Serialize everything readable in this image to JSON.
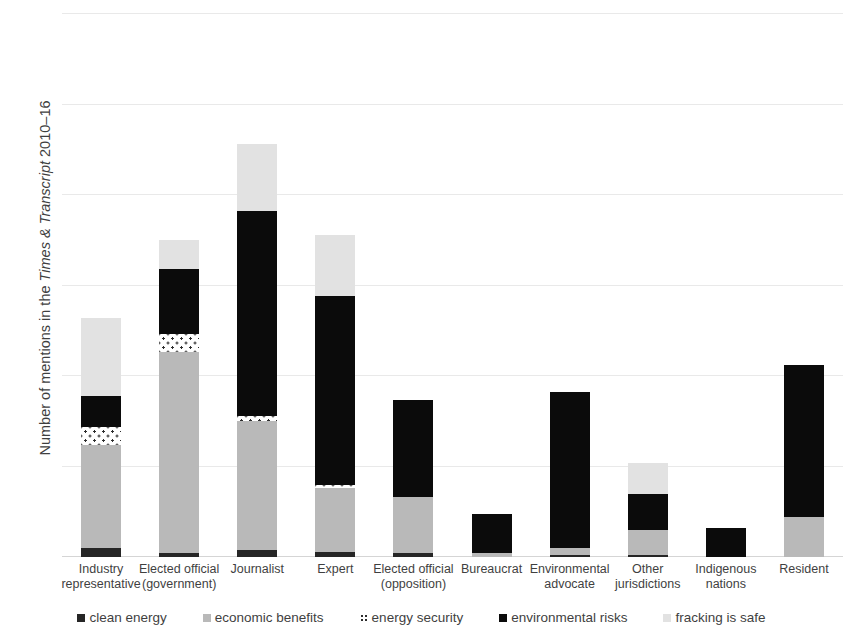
{
  "chart_data": {
    "type": "bar",
    "stacked": true,
    "title": "",
    "xlabel": "",
    "ylabel": "Number of mentions in the Times & Transcript 2010–16",
    "ylabel_parts": {
      "prefix": "Number of mentions in the ",
      "italic": "Times & Transcript",
      "suffix": " 2010–16"
    },
    "ylim": [
      0,
      300
    ],
    "ytick_labels": [
      "0",
      "50",
      "100",
      "150",
      "200",
      "250",
      "300"
    ],
    "ytick_values": [
      0,
      50,
      100,
      150,
      200,
      250,
      300
    ],
    "grid": true,
    "legend_position": "bottom",
    "categories": [
      "Industry representative",
      "Elected official (government)",
      "Journalist",
      "Expert",
      "Elected official (opposition)",
      "Bureaucrat",
      "Environmental advocate",
      "Other jurisdictions",
      "Indigenous nations",
      "Resident"
    ],
    "category_lines": [
      [
        "Industry",
        "representative"
      ],
      [
        "Elected official",
        "(government)"
      ],
      [
        "Journalist"
      ],
      [
        "Expert"
      ],
      [
        "Elected official",
        "(opposition)"
      ],
      [
        "Bureaucrat"
      ],
      [
        "Environmental",
        "advocate"
      ],
      [
        "Other",
        "jurisdictions"
      ],
      [
        "Indigenous",
        "nations"
      ],
      [
        "Resident"
      ]
    ],
    "series": [
      {
        "name": "clean energy",
        "color": "#262626",
        "values": [
          5,
          2,
          4,
          3,
          2,
          0,
          1,
          1,
          0,
          0
        ]
      },
      {
        "name": "economic benefits",
        "color": "#b9b9b9",
        "values": [
          57,
          111,
          71,
          35,
          31,
          2,
          4,
          14,
          0,
          22
        ]
      },
      {
        "name": "energy security",
        "color": "#ffffff",
        "pattern": "dotted",
        "values": [
          10,
          10,
          3,
          2,
          0,
          0,
          0,
          0,
          0,
          0
        ]
      },
      {
        "name": "environmental risks",
        "color": "#0b0b0b",
        "values": [
          17,
          36,
          113,
          104,
          54,
          22,
          86,
          20,
          16,
          84
        ]
      },
      {
        "name": "fracking is safe",
        "color": "#e2e2e2",
        "values": [
          43,
          16,
          37,
          34,
          0,
          0,
          0,
          17,
          0,
          0
        ]
      }
    ],
    "totals": [
      132,
      175,
      228,
      178,
      87,
      24,
      91,
      52,
      16,
      106
    ]
  },
  "legend": {
    "items": [
      {
        "label": "clean energy",
        "swatch": "clean-energy-swatch"
      },
      {
        "label": "economic benefits",
        "swatch": "economic-benefits-swatch"
      },
      {
        "label": "energy security",
        "swatch": "energy-security-swatch"
      },
      {
        "label": "environmental risks",
        "swatch": "environmental-risks-swatch"
      },
      {
        "label": "fracking is safe",
        "swatch": "fracking-is-safe-swatch"
      }
    ]
  }
}
